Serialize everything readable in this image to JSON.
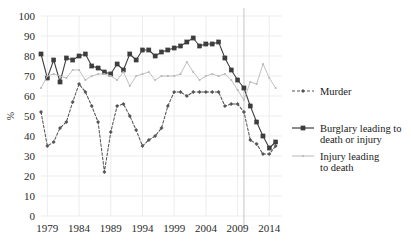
{
  "chart_data": {
    "type": "line",
    "title": "",
    "xlabel": "",
    "ylabel": "%",
    "xlim": [
      1978,
      2016
    ],
    "ylim": [
      0,
      100
    ],
    "ytick_step": 10,
    "yticks": [
      0,
      10,
      20,
      30,
      40,
      50,
      60,
      70,
      80,
      90,
      100
    ],
    "xticks": [
      1979,
      1984,
      1989,
      1994,
      1999,
      2004,
      2009,
      2014
    ],
    "grid": "horizontal-and-vertical-light",
    "legend_position": "right",
    "annotations": [
      {
        "name": "vertical-reference-line",
        "x": 2010
      }
    ],
    "x": [
      1978,
      1979,
      1980,
      1981,
      1982,
      1983,
      1984,
      1985,
      1986,
      1987,
      1988,
      1989,
      1990,
      1991,
      1992,
      1993,
      1994,
      1995,
      1996,
      1997,
      1998,
      1999,
      2000,
      2001,
      2002,
      2003,
      2004,
      2005,
      2006,
      2007,
      2008,
      2009,
      2010,
      2011,
      2012,
      2013,
      2014,
      2015
    ],
    "series": [
      {
        "name": "Murder",
        "color": "#555555",
        "style": "dashed",
        "marker": "small-diamond",
        "values": [
          52,
          35,
          37,
          44,
          47,
          57,
          66,
          62,
          55,
          47,
          22,
          42,
          55,
          56,
          50,
          43,
          35,
          38,
          40,
          44,
          55,
          62,
          62,
          60,
          62,
          62,
          62,
          62,
          62,
          55,
          56,
          56,
          52,
          38,
          36,
          31,
          31,
          35
        ]
      },
      {
        "name": "Burglary leading to death or injury",
        "color": "#3d3d3d",
        "style": "solid",
        "marker": "filled-square",
        "values": [
          81,
          69,
          78,
          67,
          79,
          78,
          80,
          81,
          75,
          74,
          72,
          71,
          76,
          73,
          81,
          78,
          83,
          83,
          80,
          82,
          83,
          84,
          85,
          87,
          89,
          85,
          86,
          86,
          87,
          79,
          73,
          68,
          64,
          55,
          47,
          40,
          34,
          37
        ]
      },
      {
        "name": "Injury leading to death",
        "color": "#b9b9b9",
        "style": "solid-light",
        "marker": "small-dot",
        "values": [
          64,
          70,
          71,
          70,
          69,
          73,
          73,
          68,
          70,
          71,
          71,
          70,
          68,
          72,
          65,
          70,
          71,
          72,
          68,
          70,
          70,
          70,
          71,
          77,
          72,
          68,
          70,
          71,
          70,
          71,
          68,
          63,
          58,
          67,
          66,
          76,
          69,
          64
        ]
      }
    ]
  },
  "legend": {
    "items": [
      {
        "label": "Murder",
        "label2": "",
        "key": "murder"
      },
      {
        "label": "Burglary leading to",
        "label2": "death or injury",
        "key": "burglary"
      },
      {
        "label": "Injury leading",
        "label2": "to death",
        "key": "injury"
      }
    ]
  },
  "axes": {
    "y_label": "%",
    "y_ticks": [
      "100",
      "90",
      "80",
      "70",
      "60",
      "50",
      "40",
      "30",
      "20",
      "10",
      "0"
    ],
    "x_ticks": [
      "1979",
      "1984",
      "1989",
      "1994",
      "1999",
      "2004",
      "2009",
      "2014"
    ]
  },
  "colors": {
    "murder": "#555555",
    "burglary": "#3d3d3d",
    "injury": "#b9b9b9",
    "grid": "#e8e8ea",
    "text": "#1a1a1a",
    "background": "#ffffff"
  }
}
